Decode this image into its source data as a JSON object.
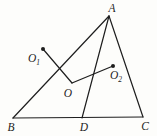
{
  "figure": {
    "background_color": "#fdfdfb",
    "line_color": "#1e1e1e",
    "labels": {
      "A": "A",
      "B": "B",
      "C": "C",
      "D": "D",
      "O": "O",
      "O1": {
        "base": "O",
        "sub": "1"
      },
      "O2": {
        "base": "O",
        "sub": "2"
      }
    },
    "points": {
      "A": {
        "x": 109,
        "y": 16
      },
      "B": {
        "x": 13,
        "y": 118
      },
      "C": {
        "x": 143,
        "y": 117
      },
      "D": {
        "x": 82,
        "y": 118
      },
      "O": {
        "x": 72,
        "y": 83
      },
      "O1": {
        "x": 43,
        "y": 49
      },
      "O2": {
        "x": 113,
        "y": 66
      }
    },
    "dot_radius": 2,
    "segments": [
      {
        "from": "A",
        "to": "B",
        "kind": "triangle-edge"
      },
      {
        "from": "B",
        "to": "C",
        "kind": "triangle-edge"
      },
      {
        "from": "C",
        "to": "A",
        "kind": "triangle-edge"
      },
      {
        "from": "A",
        "to": "D",
        "kind": "cevian"
      },
      {
        "from": "O1",
        "to": "O",
        "kind": "segment"
      },
      {
        "from": "O",
        "to": "O2",
        "kind": "segment"
      }
    ]
  }
}
